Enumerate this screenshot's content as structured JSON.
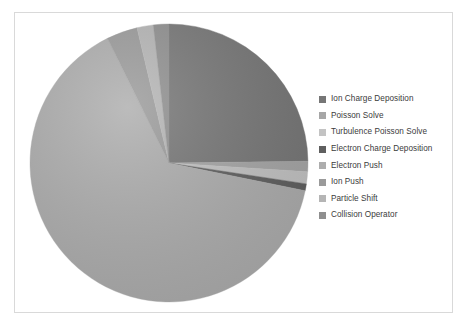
{
  "chart_data": {
    "type": "pie",
    "title": "",
    "legend_position": "right",
    "grid": false,
    "categories": [
      "Ion Charge Deposition",
      "Poisson Solve",
      "Turbulence Poisson Solve",
      "Electron Charge Deposition",
      "Electron Push",
      "Ion Push",
      "Particle Shift",
      "Collision Operator"
    ],
    "values": [
      24.8,
      1.2,
      1.4,
      0.8,
      64.5,
      3.6,
      1.9,
      1.8
    ],
    "colors": [
      "#767676",
      "#a6a6a6",
      "#c3c3c3",
      "#5f5f5f",
      "#adadad",
      "#9a9a9a",
      "#b5b5b5",
      "#8f8f8f"
    ],
    "start_angle": 0,
    "direction": "clockwise"
  },
  "legend": {
    "items": [
      {
        "label": "Ion Charge Deposition",
        "color": "#767676"
      },
      {
        "label": "Poisson Solve",
        "color": "#a6a6a6"
      },
      {
        "label": "Turbulence Poisson Solve",
        "color": "#c3c3c3"
      },
      {
        "label": "Electron Charge Deposition",
        "color": "#5f5f5f"
      },
      {
        "label": "Electron Push",
        "color": "#adadad"
      },
      {
        "label": "Ion Push",
        "color": "#9a9a9a"
      },
      {
        "label": "Particle Shift",
        "color": "#b5b5b5"
      },
      {
        "label": "Collision Operator",
        "color": "#8f8f8f"
      }
    ]
  },
  "frame": {
    "border_color": "#d9d9d9",
    "background": "#ffffff"
  }
}
